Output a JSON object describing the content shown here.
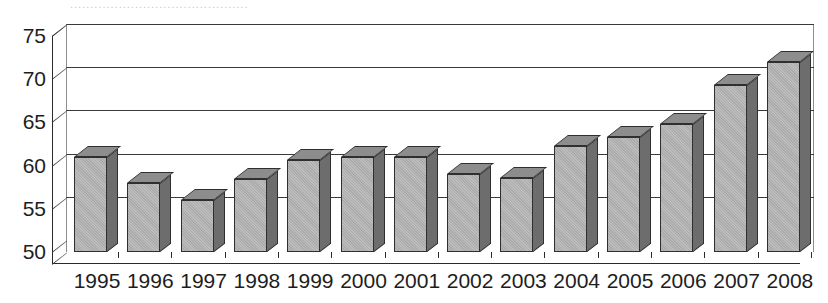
{
  "title_sliver": "............................................",
  "chart_data": {
    "type": "bar",
    "title": "",
    "xlabel": "",
    "ylabel": "",
    "ylim": [
      50,
      75
    ],
    "yticks": [
      50,
      55,
      60,
      65,
      70,
      75
    ],
    "grid": true,
    "legend": "none",
    "style": "3d-column",
    "categories": [
      "1995",
      "1996",
      "1997",
      "1998",
      "1999",
      "2000",
      "2001",
      "2002",
      "2003",
      "2004",
      "2005",
      "2006",
      "2007",
      "2008"
    ],
    "values": [
      61.0,
      58.0,
      56.0,
      58.5,
      60.7,
      61.0,
      61.0,
      59.0,
      58.6,
      62.3,
      63.3,
      64.8,
      69.3,
      72.0
    ],
    "series": [
      {
        "name": "series-1",
        "values": [
          61.0,
          58.0,
          56.0,
          58.5,
          60.7,
          61.0,
          61.0,
          59.0,
          58.6,
          62.3,
          63.3,
          64.8,
          69.3,
          72.0
        ]
      }
    ]
  },
  "colors": {
    "bar_front": "#b3b3b3",
    "bar_side": "#6d6d6d",
    "bar_top": "#8d8d8d",
    "bar_outline": "#2f2f2f",
    "gridline": "#3a3a3a",
    "axis": "#2b2b2b",
    "background": "#ffffff"
  }
}
